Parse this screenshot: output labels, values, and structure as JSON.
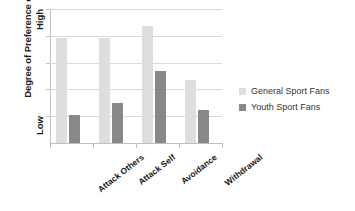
{
  "chart_data": {
    "type": "bar",
    "title": "",
    "xlabel": "",
    "ylabel": "Degree of Preference of Use",
    "categories": [
      "Attack Others",
      "Attack Self",
      "Avoidance",
      "Withdrawal"
    ],
    "series": [
      {
        "name": "General Sport Fans",
        "color": "#dedede",
        "values": [
          3.92,
          3.92,
          4.37,
          2.35
        ]
      },
      {
        "name": "Youth Sport Fans",
        "color": "#888888",
        "values": [
          1.04,
          1.49,
          2.69,
          1.23
        ]
      }
    ],
    "ylim": [
      0,
      5
    ],
    "y_tick_labels": [
      "High",
      "Low"
    ],
    "y_tick_high": "High",
    "y_tick_low": "Low",
    "gridlines": 5,
    "grid": true,
    "legend_position": "right",
    "orientation": "vertical",
    "grouped": true
  },
  "axis": {
    "y_title": "Degree of Preference of Use",
    "y_top_label": "High",
    "y_bottom_label": "Low"
  },
  "legend": {
    "items": [
      {
        "label": "General Sport Fans",
        "color": "#dedede"
      },
      {
        "label": "Youth Sport Fans",
        "color": "#888888"
      }
    ]
  },
  "colors": {
    "series_general": "#dedede",
    "series_youth": "#888888",
    "gridline": "#d9d9d9",
    "axis": "#bfbfbf",
    "text": "#1a1a1a",
    "legend_text": "#333333",
    "background": "#ffffff"
  }
}
